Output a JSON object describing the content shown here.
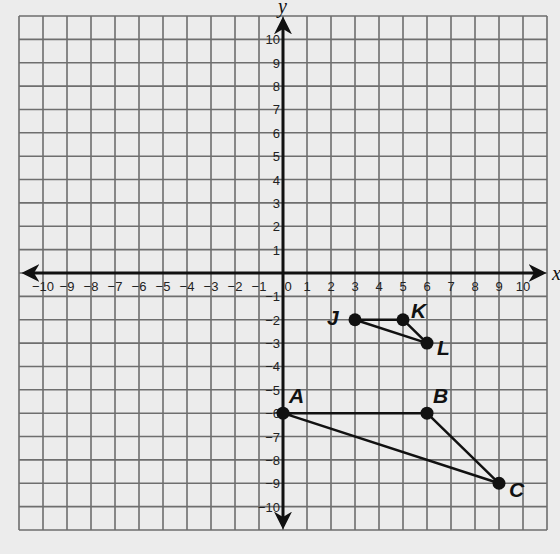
{
  "chart_data": {
    "type": "scatter",
    "title": "",
    "xlabel": "x",
    "ylabel": "y",
    "xlim": [
      -11,
      11
    ],
    "ylim": [
      -11,
      11
    ],
    "grid": true,
    "x_ticks": [
      -10,
      -9,
      -8,
      -7,
      -6,
      -5,
      -4,
      -3,
      -2,
      -1,
      0,
      1,
      2,
      3,
      4,
      5,
      6,
      7,
      8,
      9,
      10
    ],
    "y_ticks": [
      -10,
      -9,
      -8,
      -7,
      -6,
      -5,
      -4,
      -3,
      -2,
      -1,
      1,
      2,
      3,
      4,
      5,
      6,
      7,
      8,
      9,
      10
    ],
    "points": [
      {
        "label": "J",
        "x": 3,
        "y": -2
      },
      {
        "label": "K",
        "x": 5,
        "y": -2
      },
      {
        "label": "L",
        "x": 6,
        "y": -3
      },
      {
        "label": "A",
        "x": 0,
        "y": -6
      },
      {
        "label": "B",
        "x": 6,
        "y": -6
      },
      {
        "label": "C",
        "x": 9,
        "y": -9
      }
    ],
    "series": [
      {
        "name": "Triangle JKL",
        "vertices": [
          "J",
          "K",
          "L"
        ]
      },
      {
        "name": "Triangle ABC",
        "vertices": [
          "A",
          "B",
          "C"
        ]
      }
    ]
  },
  "colors": {
    "background": "#ececec",
    "grid": "#6e6e6e",
    "axis": "#111111",
    "points": "#111111"
  }
}
